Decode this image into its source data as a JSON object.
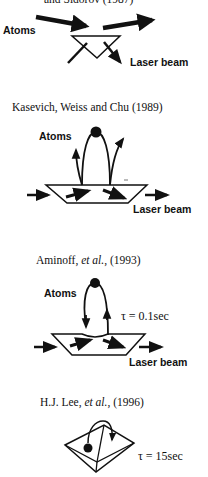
{
  "figure": {
    "panels": [
      {
        "id": "balykin",
        "title": "and Sidorov (1987)",
        "atoms_label": "Atoms",
        "laser_label": "Laser beam"
      },
      {
        "id": "kasevich",
        "title": "Kasevich, Weiss and Chu (1989)",
        "atoms_label": "Atoms",
        "laser_label": "Laser beam"
      },
      {
        "id": "aminoff",
        "title_prefix": "Aminoff, ",
        "title_italic": "et al.",
        "title_suffix": ", (1993)",
        "atoms_label": "Atoms",
        "tau_label": "τ = 0.1sec",
        "laser_label": "Laser beam"
      },
      {
        "id": "lee",
        "title_prefix": "H.J. Lee, ",
        "title_italic": "et al.",
        "title_suffix": ", (1996)",
        "tau_label": "τ = 15sec"
      }
    ],
    "colors": {
      "ink": "#111111",
      "background": "#ffffff"
    }
  }
}
